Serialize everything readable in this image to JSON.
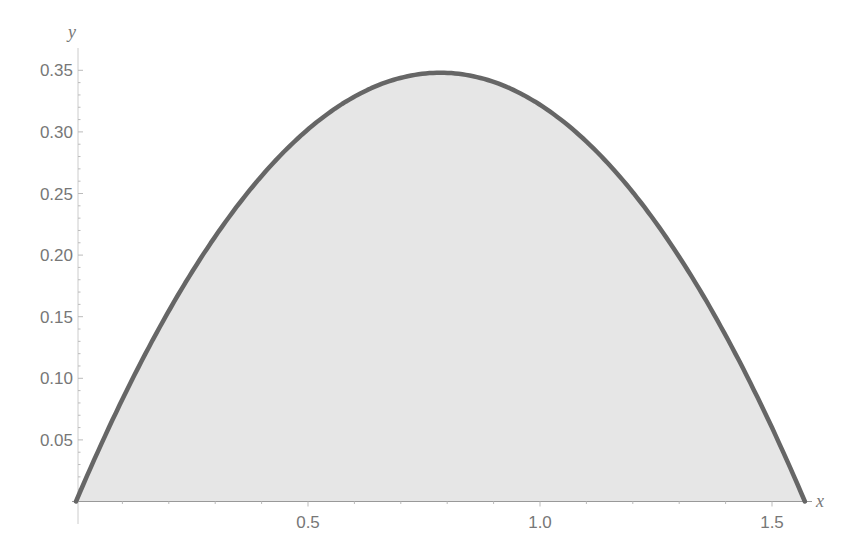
{
  "chart_data": {
    "type": "area",
    "title": "",
    "xlabel": "x",
    "ylabel": "y",
    "xlim": [
      0,
      1.5708
    ],
    "ylim": [
      0,
      0.36
    ],
    "x_ticks": [
      0.5,
      1.0,
      1.5
    ],
    "x_tick_labels": [
      "0.5",
      "1.0",
      "1.5"
    ],
    "y_ticks": [
      0.05,
      0.1,
      0.15,
      0.2,
      0.25,
      0.3,
      0.35
    ],
    "y_tick_labels": [
      "0.05",
      "0.10",
      "0.15",
      "0.20",
      "0.25",
      "0.30",
      "0.35"
    ],
    "grid": false,
    "legend": null,
    "series": [
      {
        "name": "curve",
        "x": [
          0.0,
          0.1,
          0.2,
          0.3,
          0.4,
          0.5,
          0.6,
          0.7,
          0.785,
          0.9,
          1.0,
          1.1,
          1.2,
          1.3,
          1.4,
          1.5,
          1.5708
        ],
        "values": [
          0.0,
          0.083,
          0.154,
          0.215,
          0.264,
          0.302,
          0.329,
          0.344,
          0.348,
          0.342,
          0.322,
          0.292,
          0.251,
          0.199,
          0.136,
          0.062,
          0.0
        ],
        "fill": "#e6e6e6",
        "stroke": "#666666"
      }
    ],
    "colors": {
      "fill": "#e6e6e6",
      "stroke": "#666666",
      "axis": "#999999",
      "text": "#777777"
    }
  }
}
